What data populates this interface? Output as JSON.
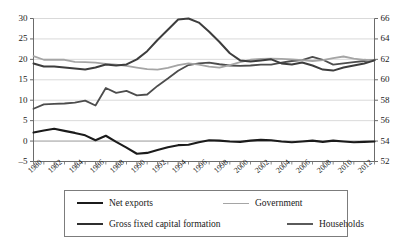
{
  "chart_data": {
    "type": "line",
    "title": "",
    "xlabel": "",
    "ylabel": "",
    "grid": true,
    "legend_position": "bottom",
    "x": [
      1980,
      1981,
      1982,
      1983,
      1984,
      1985,
      1986,
      1987,
      1988,
      1989,
      1990,
      1991,
      1992,
      1993,
      1994,
      1995,
      1996,
      1997,
      1998,
      1999,
      2000,
      2001,
      2002,
      2003,
      2004,
      2005,
      2006,
      2007,
      2008,
      2009,
      2010,
      2011,
      2012,
      2013
    ],
    "x_tick_labels": [
      "1980",
      "1982",
      "1984",
      "1986",
      "1988",
      "1990",
      "1992",
      "1994",
      "1996",
      "1998",
      "2000",
      "2002",
      "2004",
      "2006",
      "2008",
      "2010",
      "2012"
    ],
    "left_axis": {
      "ylim": [
        -5,
        30
      ],
      "ticks": [
        -5,
        0,
        5,
        10,
        15,
        20,
        25,
        30
      ],
      "tick_labels": [
        "–5",
        "0",
        "5",
        "10",
        "15",
        "20",
        "25",
        "30"
      ]
    },
    "right_axis": {
      "ylim": [
        52,
        66
      ],
      "ticks": [
        52,
        54,
        56,
        58,
        60,
        62,
        64,
        66
      ],
      "tick_labels": [
        "52",
        "54",
        "56",
        "58",
        "60",
        "62",
        "64",
        "66"
      ]
    },
    "series": [
      {
        "name": "Net exports",
        "axis": "left",
        "color": "#1b1b1b",
        "width": 2.1,
        "values": [
          2.1,
          2.6,
          3.0,
          2.5,
          2.0,
          1.4,
          0.2,
          1.3,
          -0.2,
          -1.6,
          -3.1,
          -2.9,
          -2.2,
          -1.5,
          -1.0,
          -0.9,
          -0.3,
          0.2,
          0.1,
          -0.1,
          -0.2,
          0.1,
          0.3,
          0.2,
          -0.1,
          -0.3,
          -0.1,
          0.1,
          -0.2,
          0.1,
          -0.1,
          -0.3,
          -0.2,
          -0.1
        ]
      },
      {
        "name": "Gross fixed capital formation",
        "axis": "left",
        "color": "#4d4d4d",
        "width": 1.8,
        "values": [
          7.9,
          9.0,
          9.1,
          9.2,
          9.4,
          9.9,
          8.7,
          13.0,
          11.8,
          12.3,
          11.2,
          11.4,
          13.5,
          15.3,
          17.2,
          18.6,
          19.0,
          19.2,
          18.8,
          18.5,
          18.4,
          18.5,
          18.7,
          18.7,
          19.2,
          19.6,
          19.8,
          20.6,
          19.9,
          18.7,
          19.0,
          19.3,
          19.6,
          19.8
        ]
      },
      {
        "name": "Government",
        "axis": "left",
        "color": "#a5a5a5",
        "width": 1.8,
        "values": [
          20.8,
          19.9,
          19.9,
          19.9,
          19.4,
          19.3,
          19.2,
          18.9,
          18.7,
          18.4,
          18.0,
          17.6,
          17.5,
          17.9,
          18.6,
          19.0,
          18.7,
          18.2,
          18.0,
          18.6,
          19.3,
          19.9,
          20.1,
          20.2,
          20.1,
          20.0,
          19.8,
          19.6,
          19.8,
          20.3,
          20.7,
          20.2,
          19.9,
          19.7
        ]
      },
      {
        "name": "Households",
        "axis": "right",
        "color": "#3d3d3d",
        "width": 2.0,
        "values": [
          61.6,
          61.3,
          61.3,
          61.2,
          61.1,
          61.0,
          61.2,
          61.5,
          61.4,
          61.5,
          62.0,
          62.8,
          63.9,
          64.9,
          65.9,
          66.0,
          65.6,
          64.7,
          63.7,
          62.6,
          61.9,
          61.8,
          61.9,
          62.0,
          61.6,
          61.5,
          61.7,
          61.4,
          61.0,
          60.9,
          61.2,
          61.4,
          61.6,
          61.9
        ]
      }
    ]
  },
  "legend": {
    "items": [
      {
        "label": "Net exports",
        "color": "#1b1b1b",
        "width": 2.4
      },
      {
        "label": "Government",
        "color": "#a5a5a5",
        "width": 1.9
      },
      {
        "label": "Gross fixed capital formation",
        "color": "#2f2f2f",
        "width": 2.0
      },
      {
        "label": "Households",
        "color": "#5a5a5a",
        "width": 2.0
      }
    ]
  }
}
